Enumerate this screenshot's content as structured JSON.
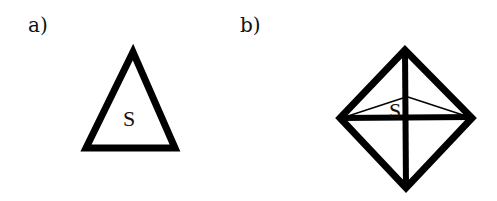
{
  "panels": [
    {
      "label": "a)",
      "shape": "triangle",
      "vertex_label": "S"
    },
    {
      "label": "b)",
      "shape": "octahedron (diamond with cross and face lines)",
      "vertex_label": "S"
    }
  ],
  "colors": {
    "stroke": "#000000",
    "background": "#ffffff"
  }
}
